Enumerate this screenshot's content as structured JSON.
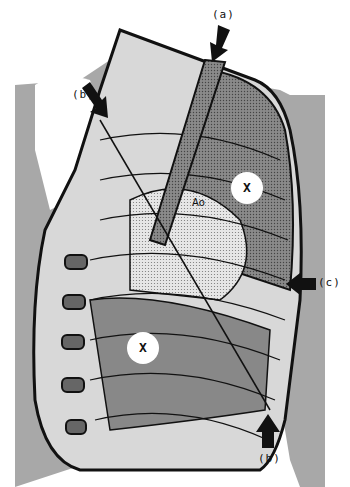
{
  "diagram": {
    "type": "anatomical-illustration",
    "labels": {
      "a": "(a)",
      "b_top": "(b)",
      "c": "(c)",
      "b_bottom": "(b)",
      "aorta": "Ao",
      "x_upper": "X",
      "x_lower": "X"
    },
    "colors": {
      "background": "#ffffff",
      "body_gray": "#a8a8a8",
      "lung_dark": "#7a7a7a",
      "light_fill": "#d8d8d8",
      "ink": "#111111"
    }
  }
}
